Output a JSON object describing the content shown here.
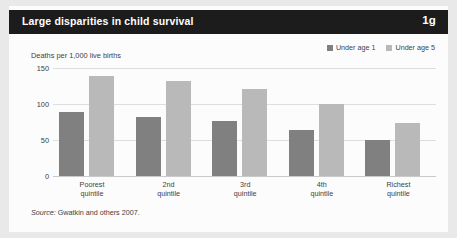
{
  "header": {
    "title": "Large disparities in child survival",
    "badge": "1g"
  },
  "legend": [
    {
      "label": "Under age 1",
      "color": "#808080",
      "swatch_name": "legend-swatch-under-age-1"
    },
    {
      "label": "Under age 5",
      "color": "#b9b9b9",
      "swatch_name": "legend-swatch-under-age-5"
    }
  ],
  "source": {
    "prefix": "Source:",
    "text": " Gwatkin and others 2007."
  },
  "chart_data": {
    "type": "bar",
    "title": "Large disparities in child survival",
    "xlabel": "",
    "ylabel": "Deaths per 1,000 live births",
    "categories": [
      "Poorest\nquintile",
      "2nd\nquintile",
      "3rd\nquintile",
      "4th\nquintile",
      "Richest\nquintile"
    ],
    "category_lines": [
      [
        "Poorest",
        "quintile"
      ],
      [
        "2nd",
        "quintile"
      ],
      [
        "3rd",
        "quintile"
      ],
      [
        "4th",
        "quintile"
      ],
      [
        "Richest",
        "quintile"
      ]
    ],
    "series": [
      {
        "name": "Under age 1",
        "color": "#808080",
        "values": [
          89,
          82,
          76,
          64,
          50
        ]
      },
      {
        "name": "Under age 5",
        "color": "#b9b9b9",
        "values": [
          139,
          132,
          121,
          100,
          73
        ]
      }
    ],
    "ylim": [
      0,
      150
    ],
    "yticks": [
      0,
      50,
      100,
      150
    ],
    "ytick_labels": [
      "0",
      "50",
      "100",
      "150"
    ],
    "grid": true,
    "legend_position": "top-right"
  }
}
